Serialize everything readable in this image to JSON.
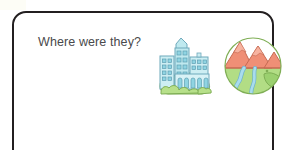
{
  "worksheet": {
    "prompt": "Where were they?",
    "card_border_color": "#231f20",
    "background_color": "#ffffff",
    "text_color": "#4a4a4c"
  },
  "illustrations": [
    {
      "id": "city-illustration",
      "name": "city",
      "alt": "City skyline with tall buildings on a green hill",
      "colors": {
        "building_fill": "#bfe9ef",
        "building_fill_light": "#d8f2f6",
        "building_outline": "#6fa9bb",
        "window_fill": "#8fd4e2",
        "window_outline": "#5f9fb2",
        "foliage": "#b7e08a",
        "foliage_outline": "#7fae55"
      }
    },
    {
      "id": "nature-illustration",
      "name": "countryside",
      "alt": "Round scene of red mountains above green land with a winding blue river",
      "colors": {
        "mountain_fill": "#ef8f76",
        "mountain_outline": "#c56a52",
        "land_fill": "#b2dd85",
        "land_outline": "#7fae55",
        "river_fill": "#a9dced",
        "river_outline": "#6fb3cc",
        "hill_shade": "#9bd06f"
      }
    }
  ]
}
